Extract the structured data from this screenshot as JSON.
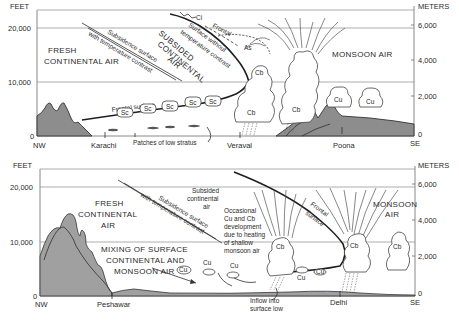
{
  "top_panel": {
    "left_axis": {
      "unit": "FEET",
      "ticks": [
        "20,000",
        "10,000",
        "0"
      ]
    },
    "right_axis": {
      "unit": "METERS",
      "ticks": [
        "6,000",
        "4,000",
        "2,000",
        "0"
      ]
    },
    "ends": {
      "left": "NW",
      "right": "SE"
    },
    "places": [
      "Karachi",
      "Veraval",
      "Poona"
    ],
    "air_masses": {
      "fresh_1": "FRESH",
      "fresh_2": "CONTINENTAL AIR",
      "subsided_1": "SUBSIDED",
      "subsided_2": "CONTINENTAL",
      "subsided_3": "AIR",
      "monsoon": "MONSOON AIR"
    },
    "surfaces": {
      "subsidence_1": "Subsidence surface",
      "subsidence_2": "with temperature contrast",
      "no_contrast_1": "Surface without",
      "no_contrast_2": "temperature contrast",
      "frontal_upper": "Frontal",
      "frontal_lower": "Frontal surface"
    },
    "annotations": {
      "patches": "Patches of low stratus"
    },
    "clouds": {
      "ci": "Ci",
      "as": "As",
      "sc": "Sc",
      "cb": "Cb",
      "cu": "Cu"
    }
  },
  "bottom_panel": {
    "left_axis": {
      "unit": "FEET",
      "ticks": [
        "20,000",
        "10,000",
        "0"
      ]
    },
    "right_axis": {
      "unit": "METERS",
      "ticks": [
        "6,000",
        "4,000",
        "2,000",
        "0"
      ]
    },
    "ends": {
      "left": "NW",
      "right": "SE"
    },
    "places": [
      "Peshawar",
      "Delhi"
    ],
    "air_masses": {
      "fresh_1": "FRESH",
      "fresh_2": "CONTINENTAL",
      "fresh_3": "AIR",
      "subsided_1": "Subsided",
      "subsided_2": "continental",
      "subsided_3": "air",
      "monsoon_1": "MONSOON",
      "monsoon_2": "AIR",
      "mixing_1": "MIXING OF SURFACE",
      "mixing_2": "CONTINENTAL AND",
      "mixing_3": "MONSOON AIR"
    },
    "surfaces": {
      "subsidence_1": "Subsidence surface",
      "subsidence_2": "with temperature contrast",
      "frontal_1": "Frontal",
      "frontal_2": "surface"
    },
    "annotations": {
      "occasional": [
        "Occasional",
        "Cu and Cb",
        "development",
        "due to heating",
        "of shallow",
        "monsoon air"
      ],
      "inflow_1": "Inflow into",
      "inflow_2": "surface low"
    },
    "clouds": {
      "cb": "Cb",
      "cu": "Cu"
    }
  }
}
